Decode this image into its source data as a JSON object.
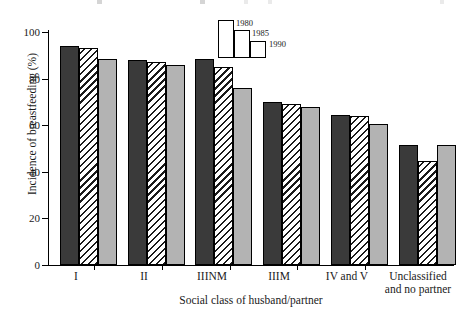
{
  "chart_data": {
    "type": "bar",
    "title": "",
    "xlabel": "Social class of husband/partner",
    "ylabel": "Incidence of breastfeeding (%)",
    "categories": [
      "I",
      "II",
      "IIINM",
      "IIIM",
      "IV and V",
      "Unclassified and no partner"
    ],
    "category_lines": [
      [
        "I"
      ],
      [
        "II"
      ],
      [
        "IIINM"
      ],
      [
        "IIIM"
      ],
      [
        "IV and V"
      ],
      [
        "Unclassified",
        "and no partner"
      ]
    ],
    "series": [
      {
        "name": "1980",
        "values": [
          94,
          88,
          88.5,
          70,
          64.5,
          51.5
        ],
        "color": "#3a3a3a",
        "pattern": "solid-dark"
      },
      {
        "name": "1985",
        "values": [
          93,
          87,
          85,
          69,
          64,
          44.5
        ],
        "color": "#ffffff",
        "pattern": "diagonal-hatch"
      },
      {
        "name": "1990",
        "values": [
          88.5,
          86,
          76,
          68,
          60.5,
          51.5
        ],
        "color": "#b3b3b3",
        "pattern": "solid-gray"
      }
    ],
    "ylim": [
      0,
      100
    ],
    "yticks": [
      0,
      20,
      40,
      60,
      80,
      100
    ],
    "ytick_labels": [
      "0",
      "20",
      "40",
      "60",
      "80",
      "100"
    ],
    "grid": false,
    "legend_position": "top-center",
    "legend_entries": [
      "1980",
      "1985",
      "1990"
    ]
  }
}
